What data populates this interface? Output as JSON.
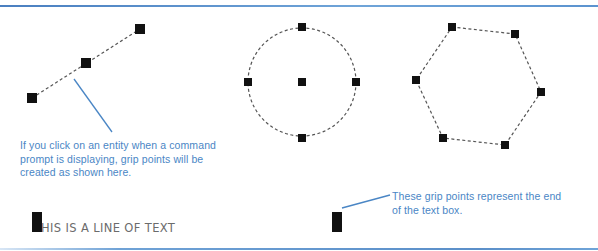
{
  "figure": {
    "rules": {
      "color": "#5b8fc9"
    },
    "grip_color": "#111111",
    "leader_color": "#4a86c5",
    "line_entity": {
      "name": "line",
      "points": [
        [
          32,
          98
        ],
        [
          140,
          29
        ]
      ],
      "grips": [
        [
          32,
          98
        ],
        [
          86,
          63
        ],
        [
          140,
          29
        ]
      ]
    },
    "circle_entity": {
      "name": "circle",
      "center": [
        302,
        82
      ],
      "radius": 54,
      "grips": [
        [
          302,
          82
        ],
        [
          302,
          27
        ],
        [
          248,
          82
        ],
        [
          356,
          82
        ],
        [
          302,
          138
        ]
      ]
    },
    "polygon_entity": {
      "name": "hexagon",
      "vertices": [
        [
          452,
          27
        ],
        [
          515,
          34
        ],
        [
          541,
          92
        ],
        [
          505,
          145
        ],
        [
          443,
          138
        ],
        [
          416,
          80
        ]
      ],
      "grips": [
        [
          452,
          27
        ],
        [
          515,
          34
        ],
        [
          541,
          92
        ],
        [
          505,
          145
        ],
        [
          443,
          138
        ],
        [
          416,
          80
        ]
      ]
    },
    "text_entity": {
      "text": "HIS IS A LINE OF TEXT",
      "note": "first letter T covered by stacked grip points"
    },
    "callouts": [
      {
        "id": "callout-1",
        "text": "If you click on an entity when a command prompt is displaying, grip points will be created as shown here.",
        "leader": [
          [
            74,
            79
          ],
          [
            112,
            132
          ]
        ]
      },
      {
        "id": "callout-2",
        "text": "These grip points represent the end of the text box.",
        "leader": [
          [
            342,
            208
          ],
          [
            390,
            195
          ]
        ]
      }
    ]
  }
}
